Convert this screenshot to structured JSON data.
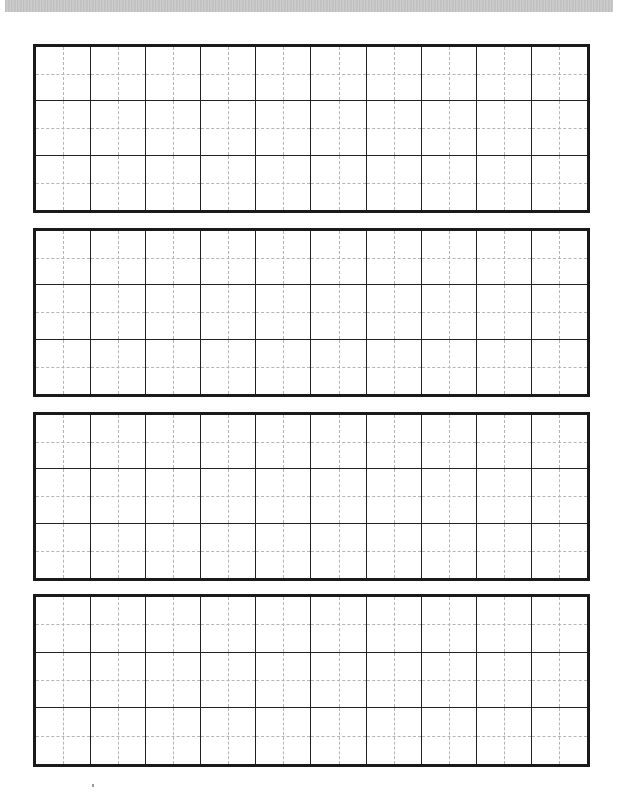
{
  "page": {
    "type": "practice-grid-sheet",
    "background": "#ffffff",
    "line_color": "#1a1a1a",
    "guide_color": "#b5b5b5"
  },
  "grids": [
    {
      "id": "grid-1",
      "top": 44,
      "height": 169,
      "columns": 10,
      "rows": 3
    },
    {
      "id": "grid-2",
      "top": 228,
      "height": 169,
      "columns": 10,
      "rows": 3
    },
    {
      "id": "grid-3",
      "top": 412,
      "height": 169,
      "columns": 10,
      "rows": 3
    },
    {
      "id": "grid-4",
      "top": 594,
      "height": 173,
      "columns": 10,
      "rows": 3
    }
  ]
}
